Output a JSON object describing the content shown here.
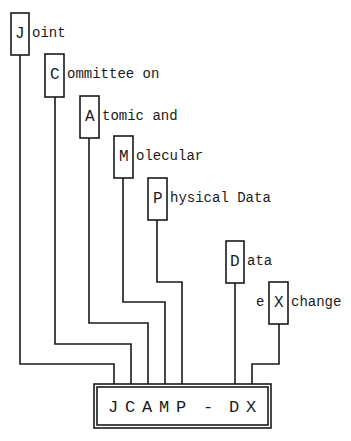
{
  "diagram": {
    "acronym_box": {
      "letters": [
        "J",
        "C",
        "A",
        "M",
        "P",
        "-",
        "D",
        "X"
      ],
      "text": "J C A M P  -  D X"
    },
    "terms": [
      {
        "letter": "J",
        "rest": "oint",
        "prefix": ""
      },
      {
        "letter": "C",
        "rest": "ommittee on",
        "prefix": ""
      },
      {
        "letter": "A",
        "rest": "tomic and",
        "prefix": ""
      },
      {
        "letter": "M",
        "rest": "olecular",
        "prefix": ""
      },
      {
        "letter": "P",
        "rest": "hysical Data",
        "prefix": ""
      },
      {
        "letter": "D",
        "rest": "ata",
        "prefix": ""
      },
      {
        "letter": "X",
        "rest": "change",
        "prefix": "e"
      }
    ],
    "colors": {
      "line": "#1a1a1a",
      "background": "#ffffff"
    }
  }
}
